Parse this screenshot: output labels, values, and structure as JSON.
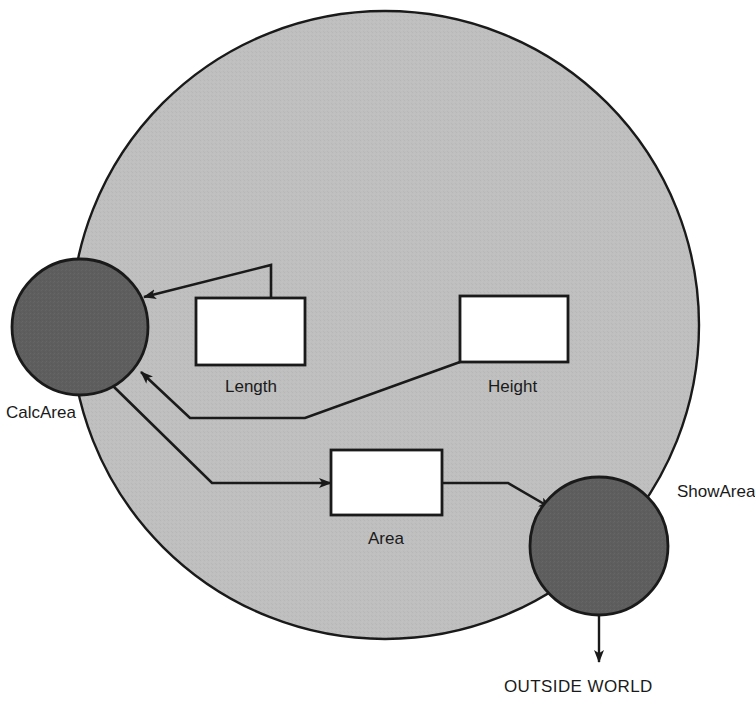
{
  "diagram": {
    "colors": {
      "system_boundary_fill": "#bfbfbf",
      "process_fill": "#5e5e5e",
      "store_fill": "#ffffff",
      "stroke": "#1a1a1a",
      "text": "#1a1a1a",
      "background": "#ffffff"
    },
    "system_boundary": {
      "name": "system-boundary",
      "cx": 385,
      "cy": 325,
      "r": 314
    },
    "processes": [
      {
        "id": "calc-area",
        "label": "CalcArea",
        "cx": 80,
        "cy": 327,
        "r": 68,
        "label_x": 6,
        "label_y": 404
      },
      {
        "id": "show-area",
        "label": "ShowArea",
        "cx": 599,
        "cy": 546,
        "r": 69,
        "label_x": 677,
        "label_y": 483
      }
    ],
    "data_stores": [
      {
        "id": "length",
        "label": "Length",
        "x": 196,
        "y": 298,
        "w": 109,
        "h": 67,
        "label_x": 225,
        "label_y": 378
      },
      {
        "id": "height",
        "label": "Height",
        "x": 460,
        "y": 296,
        "w": 108,
        "h": 66,
        "label_x": 488,
        "label_y": 378
      },
      {
        "id": "area",
        "label": "Area",
        "x": 331,
        "y": 450,
        "w": 111,
        "h": 65,
        "label_x": 368,
        "label_y": 530
      }
    ],
    "external_entities": [
      {
        "id": "outside-world",
        "label": "OUTSIDE WORLD",
        "label_x": 504,
        "label_y": 678
      }
    ],
    "flows": [
      {
        "id": "length-to-calcarea",
        "from": "length",
        "to": "calc-area",
        "points": "271,298 271,265 144,297",
        "arrow_at": "calc-area"
      },
      {
        "id": "height-to-calcarea",
        "from": "height",
        "to": "calc-area",
        "points": "460,362 305,418 190,418 141,372",
        "arrow_at": "calc-area"
      },
      {
        "id": "calcarea-to-area",
        "from": "calc-area",
        "to": "area",
        "points": "112,385 212,483 331,483",
        "arrow_at": "area"
      },
      {
        "id": "area-to-showarea",
        "from": "area",
        "to": "show-area",
        "points": "442,483 508,483 551,508",
        "arrow_at": "show-area"
      },
      {
        "id": "showarea-to-outside-world",
        "from": "show-area",
        "to": "outside-world",
        "points": "599,615 599,662",
        "arrow_at": "outside-world"
      }
    ]
  }
}
